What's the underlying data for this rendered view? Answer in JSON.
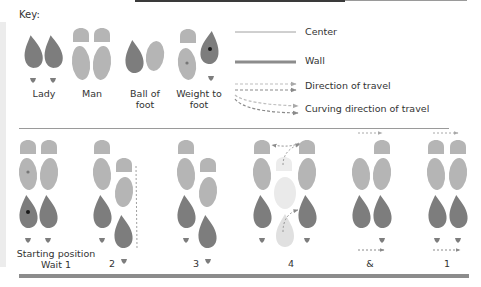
{
  "key": {
    "title": "Key:",
    "symbols": [
      {
        "label_line1": "Lady",
        "label_line2": ""
      },
      {
        "label_line1": "Man",
        "label_line2": ""
      },
      {
        "label_line1": "Ball of",
        "label_line2": "foot"
      },
      {
        "label_line1": "Weight to",
        "label_line2": "foot"
      }
    ],
    "legend": [
      {
        "label": "Center",
        "style": "thin-line"
      },
      {
        "label": "Wall",
        "style": "thick-line"
      },
      {
        "label": "Direction of travel",
        "style": "dashed-arrows"
      },
      {
        "label": "Curving direction of travel",
        "style": "curved-dashed-arrows"
      }
    ]
  },
  "steps": [
    {
      "count_line1": "Starting position",
      "count_line2": "Wait 1"
    },
    {
      "count_line1": "2",
      "count_line2": ""
    },
    {
      "count_line1": "3",
      "count_line2": ""
    },
    {
      "count_line1": "4",
      "count_line2": ""
    },
    {
      "count_line1": "&",
      "count_line2": ""
    },
    {
      "count_line1": "1",
      "count_line2": ""
    }
  ],
  "colors": {
    "lady": "#7d7d7d",
    "man": "#b5b5b5",
    "ghost": "#e2e2e2",
    "weight_dot": "#1a1a1a",
    "wall": "#8c8c8c",
    "center": "#a0a0a0",
    "arrow": "#a8a8a8"
  }
}
